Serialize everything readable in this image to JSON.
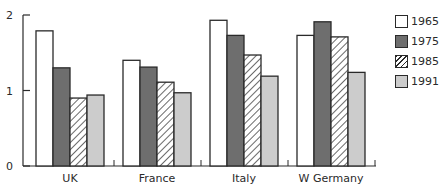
{
  "chart_data": {
    "type": "bar",
    "title": "",
    "xlabel": "",
    "ylabel": "",
    "ylim": [
      0,
      2
    ],
    "yticks": [
      0,
      1,
      2
    ],
    "grid": false,
    "legend_position": "right",
    "categories": [
      "UK",
      "France",
      "Italy",
      "W Germany"
    ],
    "series": [
      {
        "name": "1965",
        "fill": "white",
        "color": "#ffffff",
        "values": [
          1.79,
          1.4,
          1.93,
          1.73
        ]
      },
      {
        "name": "1975",
        "fill": "dark-gray",
        "color": "#6e6e6e",
        "values": [
          1.3,
          1.31,
          1.73,
          1.91
        ]
      },
      {
        "name": "1985",
        "fill": "hatched",
        "color": "#ffffff",
        "values": [
          0.9,
          1.11,
          1.47,
          1.71
        ]
      },
      {
        "name": "1991",
        "fill": "light-gray",
        "color": "#cccccc",
        "values": [
          0.94,
          0.97,
          1.19,
          1.24
        ]
      }
    ]
  },
  "legend": {
    "items": [
      {
        "label": "1965",
        "fill": "white"
      },
      {
        "label": "1975",
        "fill": "dark-gray"
      },
      {
        "label": "1985",
        "fill": "hatched"
      },
      {
        "label": "1991",
        "fill": "light-gray"
      }
    ]
  },
  "colors": {
    "axis": "#2a2a2a",
    "dark_gray": "#6e6e6e",
    "light_gray": "#cccccc",
    "white": "#ffffff"
  }
}
